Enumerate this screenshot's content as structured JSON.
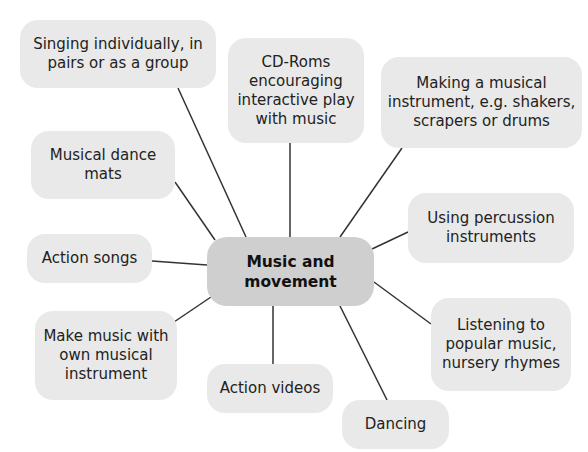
{
  "diagram": {
    "type": "mind-map",
    "center": {
      "label_lines": [
        "Music and",
        "movement"
      ],
      "box": [
        207,
        237,
        167,
        69
      ],
      "fill": "#cfcfcf"
    },
    "node_fill": "#e9e9e9",
    "line_color": "#333333",
    "nodes": [
      {
        "id": "singing",
        "label_lines": [
          "Singing individually, in",
          "pairs or as a group"
        ],
        "box": [
          20,
          20,
          196,
          68
        ],
        "line": [
          178,
          88,
          246,
          237
        ]
      },
      {
        "id": "cd-roms",
        "label_lines": [
          "CD-Roms",
          "encouraging",
          "interactive play",
          "with music"
        ],
        "box": [
          228,
          38,
          136,
          105
        ],
        "line": [
          290,
          143,
          290,
          237
        ]
      },
      {
        "id": "making-instrument",
        "label_lines": [
          "Making a musical",
          "instrument, e.g. shakers,",
          "scrapers or drums"
        ],
        "box": [
          381,
          57,
          201,
          91
        ],
        "line": [
          402,
          148,
          340,
          237
        ]
      },
      {
        "id": "dance-mats",
        "label_lines": [
          "Musical dance",
          "mats"
        ],
        "box": [
          31,
          131,
          144,
          68
        ],
        "line": [
          175,
          182,
          215,
          240
        ]
      },
      {
        "id": "percussion",
        "label_lines": [
          "Using percussion",
          "instruments"
        ],
        "box": [
          408,
          193,
          166,
          70
        ],
        "line": [
          408,
          232,
          372,
          249
        ]
      },
      {
        "id": "action-songs",
        "label_lines": [
          "Action songs"
        ],
        "box": [
          27,
          234,
          125,
          49
        ],
        "line": [
          152,
          261,
          207,
          265
        ]
      },
      {
        "id": "make-music",
        "label_lines": [
          "Make music with",
          "own musical",
          "instrument"
        ],
        "box": [
          35,
          311,
          142,
          89
        ],
        "line": [
          174,
          322,
          211,
          297
        ]
      },
      {
        "id": "listening",
        "label_lines": [
          "Listening to",
          "popular music,",
          "nursery rhymes"
        ],
        "box": [
          431,
          298,
          140,
          93
        ],
        "line": [
          431,
          324,
          374,
          282
        ]
      },
      {
        "id": "action-videos",
        "label_lines": [
          "Action videos"
        ],
        "box": [
          207,
          364,
          126,
          49
        ],
        "line": [
          273,
          306,
          273,
          364
        ]
      },
      {
        "id": "dancing",
        "label_lines": [
          "Dancing"
        ],
        "box": [
          342,
          400,
          107,
          49
        ],
        "line": [
          340,
          306,
          387,
          400
        ]
      }
    ]
  }
}
